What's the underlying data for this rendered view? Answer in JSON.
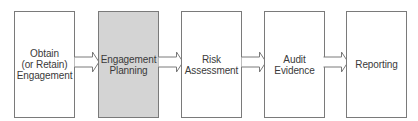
{
  "diagram": {
    "type": "process-flow",
    "direction": "left-to-right",
    "highlight_color": "#d4d4d4",
    "border_color": "#7a7a7a",
    "text_color": "#3a3a3a",
    "steps": [
      {
        "label": "Obtain\n(or Retain)\nEngagement",
        "highlighted": false
      },
      {
        "label": "Engagement\nPlanning",
        "highlighted": true
      },
      {
        "label": "Risk\nAssessment",
        "highlighted": false
      },
      {
        "label": "Audit\nEvidence",
        "highlighted": false
      },
      {
        "label": "Reporting",
        "highlighted": false
      }
    ],
    "connectors": [
      {
        "from": 0,
        "to": 1,
        "shape": "outlined-block-arrow"
      },
      {
        "from": 1,
        "to": 2,
        "shape": "outlined-block-arrow"
      },
      {
        "from": 2,
        "to": 3,
        "shape": "outlined-block-arrow"
      },
      {
        "from": 3,
        "to": 4,
        "shape": "outlined-block-arrow"
      }
    ]
  }
}
